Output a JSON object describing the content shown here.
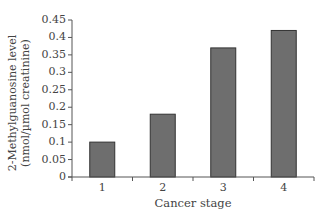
{
  "chart_data": {
    "type": "bar",
    "title": "",
    "xlabel": "Cancer stage",
    "ylabel": "2-Methylguanosine level (nmol/µmol creatinine)",
    "ylabel_lines": [
      "2-Methylguanosine level",
      "(nmol/µmol creatinine)"
    ],
    "categories": [
      "1",
      "2",
      "3",
      "4"
    ],
    "values": [
      0.1,
      0.18,
      0.37,
      0.42
    ],
    "ylim": [
      0,
      0.45
    ],
    "yticks": [
      "0",
      "0.05",
      "0.1",
      "0.15",
      "0.2",
      "0.25",
      "0.3",
      "0.35",
      "0.4",
      "0.45"
    ],
    "grid": false,
    "legend": null,
    "colors": {
      "bar_fill": "#6e6e6e",
      "bar_stroke": "#333333",
      "axis": "#555555"
    }
  }
}
